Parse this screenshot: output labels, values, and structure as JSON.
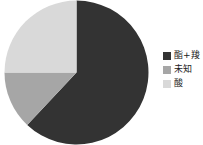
{
  "chart_data": {
    "type": "pie",
    "title": "",
    "subtitle": "",
    "xlabel": "",
    "ylabel": "",
    "grid": false,
    "legend_position": "right",
    "start_angle_deg": 0,
    "direction": "clockwise",
    "categories": [
      "酯+羧",
      "未知",
      "酸"
    ],
    "values": [
      62,
      13,
      25
    ],
    "colors": [
      "#333333",
      "#a6a6a6",
      "#d9d9d9"
    ],
    "slices": [
      {
        "label": "酯+羧",
        "value": 62,
        "color": "#333333"
      },
      {
        "label": "未知",
        "value": 13,
        "color": "#a6a6a6"
      },
      {
        "label": "酸",
        "value": 25,
        "color": "#d9d9d9"
      }
    ]
  },
  "legend": {
    "items": [
      {
        "label": "酯+羧",
        "color": "#333333"
      },
      {
        "label": "未知",
        "color": "#a6a6a6"
      },
      {
        "label": "酸",
        "color": "#d9d9d9"
      }
    ]
  },
  "colors": {
    "background": "#ffffff",
    "slice_dark": "#333333",
    "slice_medium": "#a6a6a6",
    "slice_light": "#d9d9d9",
    "text": "#1a1a1a"
  }
}
